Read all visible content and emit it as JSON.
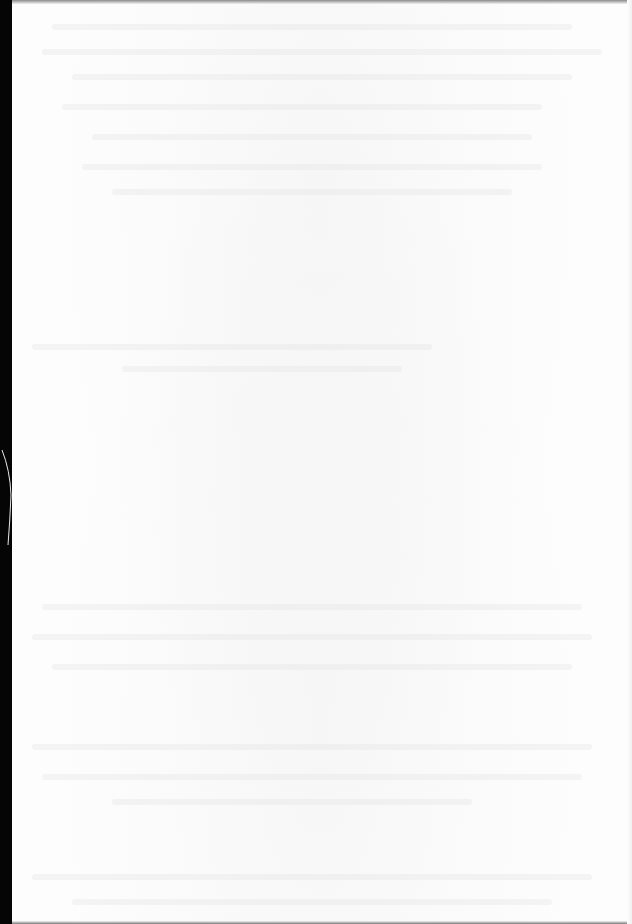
{
  "page": {
    "type": "blank scanned page",
    "text_content": "",
    "colors": {
      "paper": "#fdfdfd",
      "binding_edge": "#050505",
      "edge_shadow": "#8a8a8a",
      "bleed_through": "#e1e1e1"
    }
  }
}
